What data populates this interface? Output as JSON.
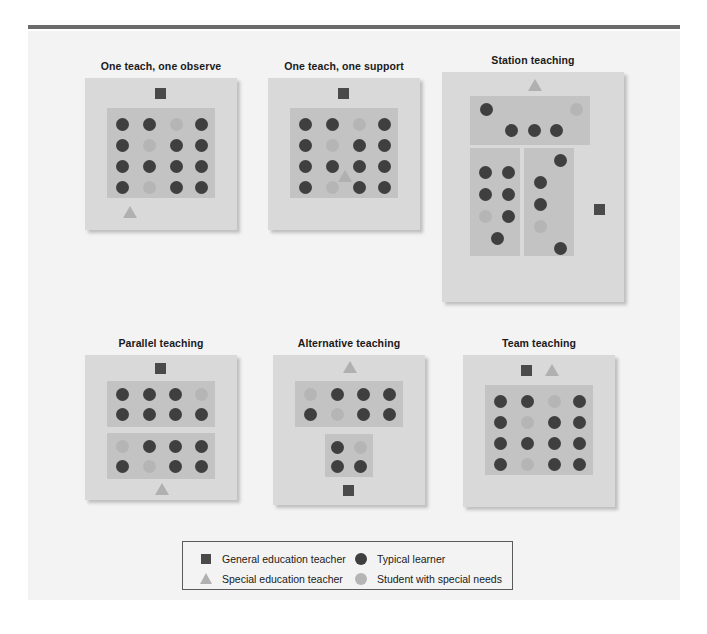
{
  "figure": {
    "background_color": "#f3f3f3",
    "rule_color": "#6b6b6b",
    "panel_color": "#d9d9d9",
    "group_color": "#c3c3c3"
  },
  "colors": {
    "typical_learner": "#3f3f3f",
    "student_special_needs": "#b5b5b5",
    "general_education_teacher": "#4a4a4a",
    "special_education_teacher": "#b0b0b0"
  },
  "panels": [
    {
      "id": "one-teach-one-observe",
      "title": "One teach, one observe",
      "teachers": [
        {
          "role": "general-education-teacher",
          "shape": "square"
        },
        {
          "role": "special-education-teacher",
          "shape": "triangle"
        }
      ],
      "groups": [
        {
          "name": "whole-class-group",
          "rows": [
            [
              "typical",
              "typical",
              "special",
              "typical"
            ],
            [
              "typical",
              "special",
              "typical",
              "typical"
            ],
            [
              "typical",
              "typical",
              "typical",
              "typical"
            ],
            [
              "typical",
              "special",
              "typical",
              "typical"
            ]
          ]
        }
      ]
    },
    {
      "id": "one-teach-one-support",
      "title": "One teach, one support",
      "teachers": [
        {
          "role": "general-education-teacher",
          "shape": "square"
        },
        {
          "role": "special-education-teacher",
          "shape": "triangle"
        }
      ],
      "groups": [
        {
          "name": "whole-class-group",
          "rows": [
            [
              "typical",
              "typical",
              "special",
              "typical"
            ],
            [
              "typical",
              "special",
              "typical",
              "typical"
            ],
            [
              "typical",
              "typical",
              "typical",
              "typical"
            ],
            [
              "typical",
              "special",
              "typical",
              "typical"
            ]
          ]
        }
      ]
    },
    {
      "id": "station-teaching",
      "title": "Station teaching",
      "teachers": [
        {
          "role": "special-education-teacher",
          "shape": "triangle"
        },
        {
          "role": "general-education-teacher",
          "shape": "square"
        }
      ],
      "groups": [
        {
          "name": "station-1-group",
          "count": 5,
          "composition": [
            "typical",
            "special",
            "typical",
            "typical",
            "typical"
          ]
        },
        {
          "name": "station-2-group",
          "count": 7,
          "composition": [
            "typical",
            "typical",
            "typical",
            "typical",
            "special",
            "typical",
            "typical"
          ]
        },
        {
          "name": "station-3-group",
          "count": 5,
          "composition": [
            "typical",
            "typical",
            "typical",
            "special",
            "typical"
          ]
        }
      ]
    },
    {
      "id": "parallel-teaching",
      "title": "Parallel teaching",
      "teachers": [
        {
          "role": "general-education-teacher",
          "shape": "square"
        },
        {
          "role": "special-education-teacher",
          "shape": "triangle"
        }
      ],
      "groups": [
        {
          "name": "parallel-group-a",
          "rows": [
            [
              "typical",
              "typical",
              "typical",
              "special"
            ],
            [
              "typical",
              "typical",
              "typical",
              "typical"
            ]
          ]
        },
        {
          "name": "parallel-group-b",
          "rows": [
            [
              "special",
              "typical",
              "typical",
              "typical"
            ],
            [
              "typical",
              "special",
              "typical",
              "typical"
            ]
          ]
        }
      ]
    },
    {
      "id": "alternative-teaching",
      "title": "Alternative teaching",
      "teachers": [
        {
          "role": "special-education-teacher",
          "shape": "triangle"
        },
        {
          "role": "general-education-teacher",
          "shape": "square"
        }
      ],
      "groups": [
        {
          "name": "large-group",
          "rows": [
            [
              "special",
              "typical",
              "typical",
              "typical"
            ],
            [
              "typical",
              "special",
              "typical",
              "typical"
            ]
          ]
        },
        {
          "name": "small-group",
          "rows": [
            [
              "typical",
              "special"
            ],
            [
              "typical",
              "typical"
            ]
          ]
        }
      ]
    },
    {
      "id": "team-teaching",
      "title": "Team teaching",
      "teachers": [
        {
          "role": "general-education-teacher",
          "shape": "square"
        },
        {
          "role": "special-education-teacher",
          "shape": "triangle"
        }
      ],
      "groups": [
        {
          "name": "whole-class-group",
          "rows": [
            [
              "typical",
              "typical",
              "special",
              "typical"
            ],
            [
              "typical",
              "special",
              "typical",
              "typical"
            ],
            [
              "typical",
              "typical",
              "typical",
              "typical"
            ],
            [
              "typical",
              "special",
              "typical",
              "typical"
            ]
          ]
        }
      ]
    }
  ],
  "legend": {
    "items": [
      {
        "icon": "square-icon",
        "label": "General education teacher"
      },
      {
        "icon": "triangle-icon",
        "label": "Special education teacher"
      },
      {
        "icon": "dark-circle-icon",
        "label": "Typical learner"
      },
      {
        "icon": "light-circle-icon",
        "label": "Student with special needs"
      }
    ]
  }
}
